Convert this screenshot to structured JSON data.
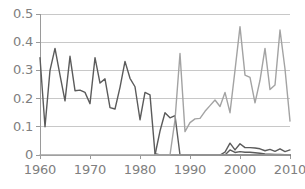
{
  "chart_data": {
    "type": "line",
    "title": "",
    "subtitle": "",
    "xlabel": "",
    "ylabel": "",
    "xlim": [
      1960,
      2010
    ],
    "ylim": [
      0,
      0.5
    ],
    "xticks": [
      1960,
      1970,
      1980,
      1990,
      2000,
      2010
    ],
    "xtick_labels": [
      "1960",
      "1970",
      "1980",
      "1990",
      "2000",
      "2010"
    ],
    "yticks": [
      0,
      0.1,
      0.2,
      0.3,
      0.4,
      0.5
    ],
    "ytick_labels": [
      "0",
      "0.1",
      "0.2",
      "0.3",
      "0.4",
      "0.5"
    ],
    "grid": {
      "horizontal": true,
      "vertical": false
    },
    "legend": {
      "visible": false,
      "position": "none"
    },
    "colors": {
      "series_dark": "#5b5b5b",
      "series_light": "#a3a3a3",
      "axis": "#9a9a9a",
      "gridline": "#c8c8c8",
      "tick_text": "#808080",
      "background": "#ffffff"
    },
    "x": [
      1960,
      1961,
      1962,
      1963,
      1964,
      1965,
      1966,
      1967,
      1968,
      1969,
      1970,
      1971,
      1972,
      1973,
      1974,
      1975,
      1976,
      1977,
      1978,
      1979,
      1980,
      1981,
      1982,
      1983,
      1984,
      1985,
      1986,
      1987,
      1988,
      1989,
      1990,
      1991,
      1992,
      1993,
      1994,
      1995,
      1996,
      1997,
      1998,
      1999,
      2000,
      2001,
      2002,
      2003,
      2004,
      2005,
      2006,
      2007,
      2008,
      2009,
      2010
    ],
    "series": [
      {
        "name": "series-dark-early",
        "color": "#5b5b5b",
        "values": [
          0.345,
          0.1,
          0.3,
          0.378,
          0.283,
          0.192,
          0.35,
          0.228,
          0.23,
          0.222,
          0.182,
          0.345,
          0.255,
          0.27,
          0.168,
          0.163,
          0.24,
          0.332,
          0.272,
          0.242,
          0.125,
          0.222,
          0.213,
          0.005,
          0.0,
          0.0,
          0.0,
          0.0,
          0.0,
          0.0,
          0.0,
          0.0,
          0.0,
          0.0,
          0.0,
          0.0,
          0.0,
          0.0,
          0.0,
          0.0,
          0.0,
          0.0,
          0.0,
          0.0,
          0.0,
          0.0,
          0.0,
          0.0,
          0.0,
          0.0,
          0.0
        ]
      },
      {
        "name": "series-dark-mid",
        "color": "#5b5b5b",
        "values": [
          null,
          null,
          null,
          null,
          null,
          null,
          null,
          null,
          null,
          null,
          null,
          null,
          null,
          null,
          null,
          null,
          null,
          null,
          null,
          null,
          null,
          null,
          null,
          0.0,
          0.085,
          0.15,
          0.132,
          0.14,
          0.0,
          0.0,
          0.0,
          0.0,
          0.0,
          0.0,
          0.0,
          0.0,
          0.0,
          0.0,
          0.0,
          0.0,
          0.0,
          0.0,
          0.0,
          0.0,
          0.0,
          0.0,
          0.0,
          0.0,
          0.0,
          0.0,
          0.0
        ]
      },
      {
        "name": "series-light-main",
        "color": "#a3a3a3",
        "values": [
          null,
          null,
          null,
          null,
          null,
          null,
          null,
          null,
          null,
          null,
          null,
          null,
          null,
          null,
          null,
          null,
          null,
          null,
          null,
          null,
          null,
          null,
          null,
          0.0,
          0.0,
          0.0,
          0.0,
          0.125,
          0.36,
          0.083,
          0.115,
          0.128,
          0.13,
          0.155,
          0.175,
          0.195,
          0.172,
          0.222,
          0.15,
          0.3,
          0.455,
          0.283,
          0.275,
          0.185,
          0.265,
          0.378,
          0.232,
          0.248,
          0.443,
          0.305,
          0.12
        ]
      },
      {
        "name": "series-dark-upper-recent",
        "color": "#5b5b5b",
        "values": [
          null,
          null,
          null,
          null,
          null,
          null,
          null,
          null,
          null,
          null,
          null,
          null,
          null,
          null,
          null,
          null,
          null,
          null,
          null,
          null,
          null,
          null,
          null,
          null,
          null,
          null,
          null,
          null,
          null,
          null,
          null,
          null,
          null,
          null,
          null,
          null,
          0.0,
          0.01,
          0.042,
          0.018,
          0.04,
          0.026,
          0.026,
          0.025,
          0.022,
          0.015,
          0.02,
          0.013,
          0.022,
          0.012,
          0.018
        ]
      },
      {
        "name": "series-dark-lower-recent",
        "color": "#5b5b5b",
        "values": [
          null,
          null,
          null,
          null,
          null,
          null,
          null,
          null,
          null,
          null,
          null,
          null,
          null,
          null,
          null,
          null,
          null,
          null,
          null,
          null,
          null,
          null,
          null,
          null,
          null,
          null,
          null,
          null,
          null,
          null,
          null,
          null,
          null,
          null,
          null,
          null,
          0.0,
          0.0,
          0.018,
          0.009,
          0.012,
          0.01,
          0.01,
          0.008,
          0.006,
          0.004,
          0.003,
          0.002,
          0.002,
          0.001,
          0.0
        ]
      },
      {
        "name": "series-baseline-zero",
        "color": "#a3a3a3",
        "values": [
          0.0,
          0.0,
          0.0,
          0.0,
          0.0,
          0.0,
          0.0,
          0.0,
          0.0,
          0.0,
          0.0,
          0.0,
          0.0,
          0.0,
          0.0,
          0.0,
          0.0,
          0.0,
          0.0,
          0.0,
          0.0,
          0.0,
          0.0,
          0.0,
          0.0,
          0.0,
          0.0,
          0.0,
          0.0,
          0.0,
          0.0,
          0.0,
          0.0,
          0.0,
          0.0,
          0.0,
          0.0,
          0.0,
          0.0,
          0.0,
          0.0,
          0.0,
          0.0,
          0.0,
          0.0,
          0.0,
          0.0,
          0.0,
          0.0,
          0.0,
          0.0
        ]
      }
    ]
  },
  "geometry": {
    "plot_left": 40,
    "plot_right": 290,
    "plot_top": 14,
    "plot_bottom": 155
  }
}
